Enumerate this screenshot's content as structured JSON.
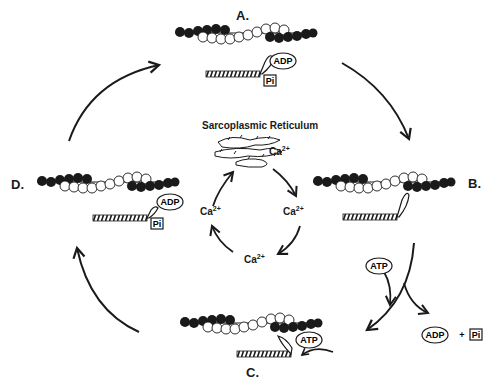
{
  "diagram": {
    "states": [
      {
        "id": "A",
        "label": "A.",
        "bound": [
          "ADP",
          "Pi"
        ]
      },
      {
        "id": "B",
        "label": "B.",
        "bound": []
      },
      {
        "id": "C",
        "label": "C.",
        "bound": [
          "ATP"
        ]
      },
      {
        "id": "D",
        "label": "D.",
        "bound": [
          "ADP",
          "Pi"
        ]
      }
    ],
    "center": {
      "title": "Sarcoplasmic Reticulum",
      "ca_base": "Ca",
      "ca_charge": "2+"
    },
    "side_reaction": {
      "input": "ATP",
      "output_1": "ADP",
      "plus": "+",
      "output_2": "Pi"
    },
    "colors": {
      "ink": "#1a1a1a",
      "background": "#ffffff"
    }
  }
}
